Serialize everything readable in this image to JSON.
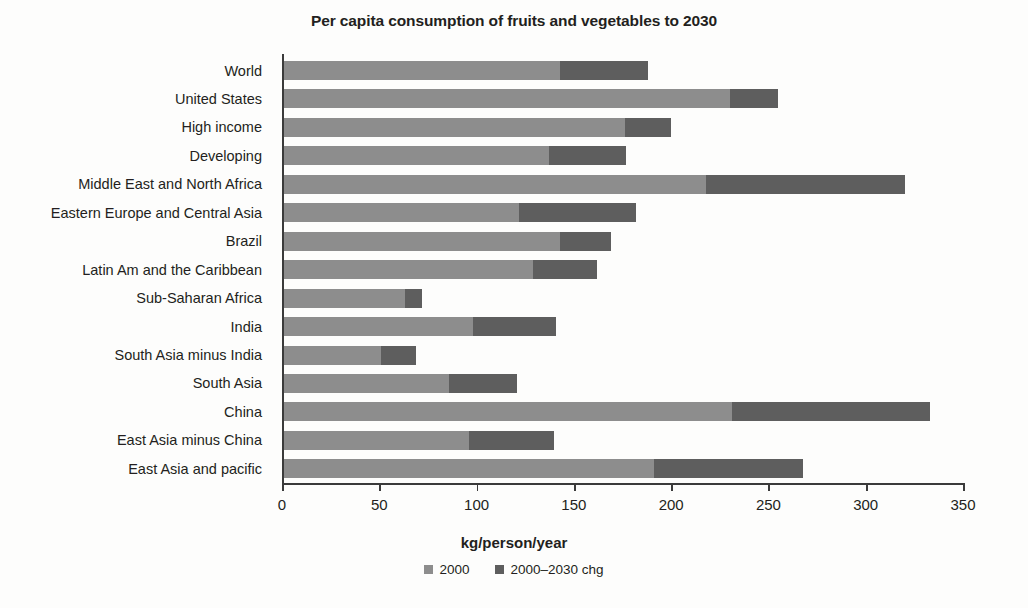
{
  "chart_data": {
    "type": "bar",
    "orientation": "horizontal",
    "stacked": true,
    "title": "Per capita consumption of fruits and vegetables  to 2030",
    "xlabel": "kg/person/year",
    "ylabel": "",
    "xlim": [
      0,
      350
    ],
    "xticks": [
      0,
      50,
      100,
      150,
      200,
      250,
      300,
      350
    ],
    "grid": false,
    "legend_position": "bottom",
    "categories": [
      "World",
      "United States",
      "High income",
      "Developing",
      "Middle East and North Africa",
      "Eastern Europe and Central Asia",
      "Brazil",
      "Latin Am and the Caribbean",
      "Sub-Saharan Africa",
      "India",
      "South Asia minus India",
      "South Asia",
      "China",
      "East Asia minus China",
      "East Asia and pacific"
    ],
    "series": [
      {
        "name": "2000",
        "color": "#8d8d8d",
        "values": [
          142,
          229,
          175,
          136,
          217,
          121,
          142,
          128,
          62,
          97,
          50,
          85,
          230,
          95,
          190
        ]
      },
      {
        "name": "2000–2030 chg",
        "color": "#5e5e5e",
        "values": [
          45,
          25,
          24,
          40,
          102,
          60,
          26,
          33,
          9,
          43,
          18,
          35,
          102,
          44,
          77
        ]
      }
    ],
    "totals": [
      187,
      254,
      199,
      176,
      319,
      181,
      168,
      161,
      71,
      140,
      68,
      120,
      332,
      139,
      267
    ]
  },
  "legend": {
    "items": [
      {
        "label": "2000",
        "color": "#8d8d8d"
      },
      {
        "label": "2000–2030 chg",
        "color": "#5e5e5e"
      }
    ]
  }
}
